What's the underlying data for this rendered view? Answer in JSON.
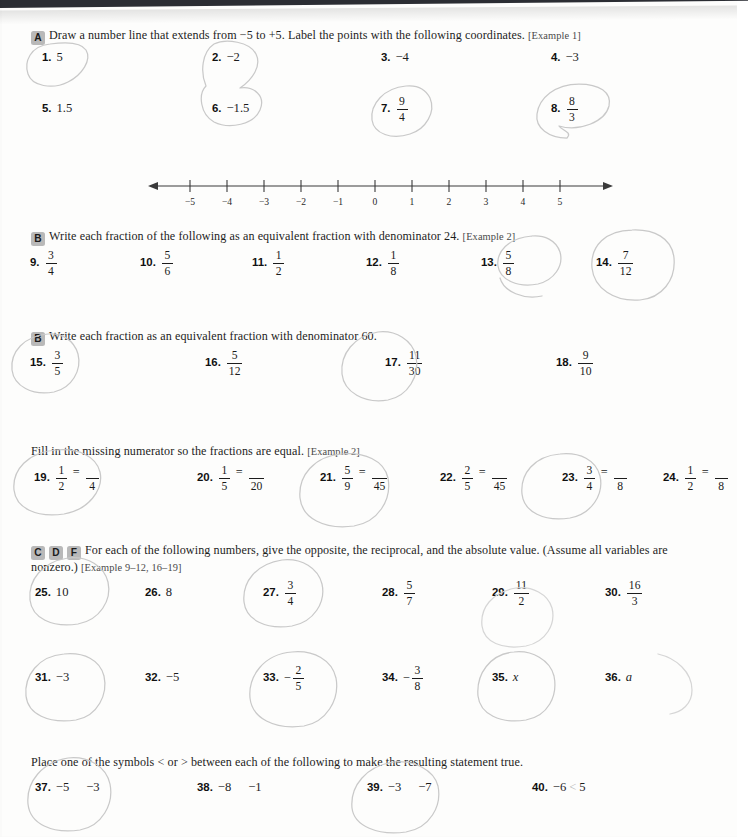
{
  "page": {
    "background_color": "#fdfdfc",
    "top_bar_color": "#2b2d33",
    "pencil_color": "#c9c9c9",
    "badge_color": "#b9b9b9"
  },
  "sections": [
    {
      "id": "section-a",
      "badges": [
        "A"
      ],
      "instruction": "Draw a number line that extends from −5 to +5. Label the points with the following coordinates.",
      "example_ref": "[Example 1]"
    },
    {
      "id": "section-b1",
      "badges": [
        "B"
      ],
      "instruction": "Write each fraction of the following as an equivalent fraction with denominator 24.",
      "example_ref": "[Example 2]"
    },
    {
      "id": "section-b2",
      "badges": [
        "B"
      ],
      "instruction": "Write each fraction as an equivalent fraction with denominator 60.",
      "example_ref": ""
    },
    {
      "id": "section-fill",
      "badges": [],
      "instruction": "Fill in the missing numerator so the fractions are equal.",
      "example_ref": "[Example 2]"
    },
    {
      "id": "section-cdf",
      "badges": [
        "C",
        "D",
        "F"
      ],
      "instruction": "For each of the following numbers, give the opposite, the reciprocal, and the absolute value. (Assume all variables are nonzero.)",
      "example_ref": "[Example 9–12, 16–19]"
    },
    {
      "id": "section-compare",
      "badges": [],
      "instruction": "Place one of the symbols < or > between each of the following to make the resulting statement true.",
      "example_ref": ""
    }
  ],
  "problems": {
    "group_a_row1": [
      {
        "n": "1.",
        "type": "plain",
        "value": "5"
      },
      {
        "n": "2.",
        "type": "plain",
        "value": "−2"
      },
      {
        "n": "3.",
        "type": "plain",
        "value": "−4"
      },
      {
        "n": "4.",
        "type": "plain",
        "value": "−3"
      }
    ],
    "group_a_row2": [
      {
        "n": "5.",
        "type": "plain",
        "value": "1.5"
      },
      {
        "n": "6.",
        "type": "plain",
        "value": "−1.5"
      },
      {
        "n": "7.",
        "type": "fraction",
        "num": "9",
        "den": "4"
      },
      {
        "n": "8.",
        "type": "fraction",
        "num": "8",
        "den": "3"
      }
    ],
    "group_b1": [
      {
        "n": "9.",
        "type": "fraction",
        "num": "3",
        "den": "4"
      },
      {
        "n": "10.",
        "type": "fraction",
        "num": "5",
        "den": "6"
      },
      {
        "n": "11.",
        "type": "fraction",
        "num": "1",
        "den": "2"
      },
      {
        "n": "12.",
        "type": "fraction",
        "num": "1",
        "den": "8"
      },
      {
        "n": "13.",
        "type": "fraction",
        "num": "5",
        "den": "8"
      },
      {
        "n": "14.",
        "type": "fraction",
        "num": "7",
        "den": "12"
      }
    ],
    "group_b2": [
      {
        "n": "15.",
        "type": "fraction",
        "num": "3",
        "den": "5"
      },
      {
        "n": "16.",
        "type": "fraction",
        "num": "5",
        "den": "12"
      },
      {
        "n": "17.",
        "type": "fraction",
        "num": "11",
        "den": "30"
      },
      {
        "n": "18.",
        "type": "fraction",
        "num": "9",
        "den": "10"
      }
    ],
    "group_fill": [
      {
        "n": "19.",
        "type": "equation",
        "left_num": "1",
        "left_den": "2",
        "right_num": "",
        "right_den": "4"
      },
      {
        "n": "20.",
        "type": "equation",
        "left_num": "1",
        "left_den": "5",
        "right_num": "",
        "right_den": "20"
      },
      {
        "n": "21.",
        "type": "equation",
        "left_num": "5",
        "left_den": "9",
        "right_num": "",
        "right_den": "45"
      },
      {
        "n": "22.",
        "type": "equation",
        "left_num": "2",
        "left_den": "5",
        "right_num": "",
        "right_den": "45"
      },
      {
        "n": "23.",
        "type": "equation",
        "left_num": "3",
        "left_den": "4",
        "right_num": "",
        "right_den": "8"
      },
      {
        "n": "24.",
        "type": "equation",
        "left_num": "1",
        "left_den": "2",
        "right_num": "",
        "right_den": "8"
      }
    ],
    "group_cdf_row1": [
      {
        "n": "25.",
        "type": "plain",
        "value": "10"
      },
      {
        "n": "26.",
        "type": "plain",
        "value": "8"
      },
      {
        "n": "27.",
        "type": "fraction",
        "num": "3",
        "den": "4"
      },
      {
        "n": "28.",
        "type": "fraction",
        "num": "5",
        "den": "7"
      },
      {
        "n": "29.",
        "type": "fraction",
        "num": "11",
        "den": "2"
      },
      {
        "n": "30.",
        "type": "fraction",
        "num": "16",
        "den": "3"
      }
    ],
    "group_cdf_row2": [
      {
        "n": "31.",
        "type": "plain",
        "value": "−3"
      },
      {
        "n": "32.",
        "type": "plain",
        "value": "−5"
      },
      {
        "n": "33.",
        "type": "signed-fraction",
        "sign": "−",
        "num": "2",
        "den": "5"
      },
      {
        "n": "34.",
        "type": "signed-fraction",
        "sign": "−",
        "num": "3",
        "den": "8"
      },
      {
        "n": "35.",
        "type": "variable",
        "value": "x"
      },
      {
        "n": "36.",
        "type": "variable",
        "value": "a"
      }
    ],
    "group_compare": [
      {
        "n": "37.",
        "type": "compare",
        "left": "−5",
        "symbol": "",
        "right": "−3"
      },
      {
        "n": "38.",
        "type": "compare",
        "left": "−8",
        "symbol": "",
        "right": "−1"
      },
      {
        "n": "39.",
        "type": "compare",
        "left": "−3",
        "symbol": "",
        "right": "−7"
      },
      {
        "n": "40.",
        "type": "compare",
        "left": "−6",
        "symbol": "<",
        "right": "5",
        "handwritten_symbol": true
      }
    ]
  },
  "number_line": {
    "min": -5,
    "max": 5,
    "tick_labels": [
      "−5",
      "−4",
      "−3",
      "−2",
      "−1",
      "0",
      "1",
      "2",
      "3",
      "4",
      "5"
    ],
    "has_left_arrow": true,
    "has_right_arrow": true,
    "axis_color": "#3a3a3a"
  }
}
